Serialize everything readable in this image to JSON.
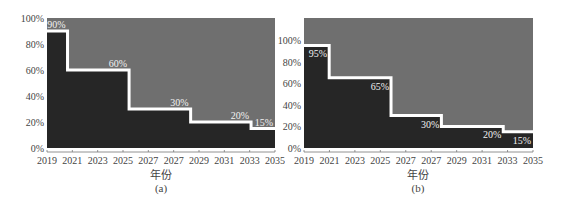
{
  "colors": {
    "upper_region": "#6f6f6f",
    "lower_region": "#262626",
    "step_line": "#ffffff",
    "axis_text": "#444444"
  },
  "chart_data": [
    {
      "type": "area",
      "subtype": "step",
      "panel_label": "(a)",
      "xlabel": "年份",
      "ylabel": "",
      "x_tick_labels": [
        "2019",
        "2021",
        "2023",
        "2025",
        "2027",
        "2027",
        "2029",
        "2031",
        "2033",
        "2035"
      ],
      "y_tick_labels": [
        "0%",
        "20%",
        "40%",
        "60%",
        "80%",
        "100%"
      ],
      "ylim": [
        0,
        100
      ],
      "grid": false,
      "legend": null,
      "steps": [
        {
          "x_start": 0.0,
          "x_end": 0.09,
          "value": 90,
          "label": "90%"
        },
        {
          "x_start": 0.09,
          "x_end": 0.36,
          "value": 60,
          "label": "60%"
        },
        {
          "x_start": 0.36,
          "x_end": 0.63,
          "value": 30,
          "label": "30%"
        },
        {
          "x_start": 0.63,
          "x_end": 0.895,
          "value": 20,
          "label": "20%"
        },
        {
          "x_start": 0.895,
          "x_end": 1.0,
          "value": 15,
          "label": "15%"
        }
      ],
      "approx_step_years": [
        2019,
        2020.7,
        2025.5,
        2028.5,
        2033.3,
        2035
      ],
      "values": [
        90,
        60,
        30,
        20,
        15
      ]
    },
    {
      "type": "area",
      "subtype": "step",
      "panel_label": "(b)",
      "xlabel": "年份",
      "ylabel": "",
      "x_tick_labels": [
        "2019",
        "2021",
        "2023",
        "2025",
        "2027",
        "2027",
        "2029",
        "2031",
        "2033",
        "2035"
      ],
      "y_tick_labels": [
        "0%",
        "20%",
        "40%",
        "60%",
        "80%",
        "100%"
      ],
      "ylim": [
        0,
        120
      ],
      "grid": false,
      "legend": null,
      "steps": [
        {
          "x_start": 0.0,
          "x_end": 0.11,
          "value": 95,
          "label": "95%"
        },
        {
          "x_start": 0.11,
          "x_end": 0.38,
          "value": 65,
          "label": "65%"
        },
        {
          "x_start": 0.38,
          "x_end": 0.6,
          "value": 30,
          "label": "30%"
        },
        {
          "x_start": 0.6,
          "x_end": 0.87,
          "value": 20,
          "label": "20%"
        },
        {
          "x_start": 0.87,
          "x_end": 1.0,
          "value": 15,
          "label": "15%"
        }
      ],
      "approx_step_years": [
        2019,
        2020.8,
        2025.8,
        2027.8,
        2032.8,
        2035
      ],
      "values": [
        95,
        65,
        30,
        20,
        15
      ]
    }
  ]
}
